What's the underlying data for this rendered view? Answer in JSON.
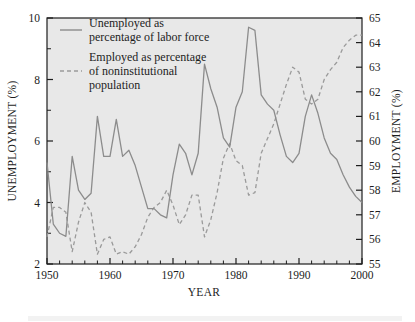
{
  "chart_data": {
    "type": "line",
    "title": "",
    "xlabel": "YEAR",
    "ylabel": "UNEMPLOYMENT (%)",
    "y2label": "EMPLOYMENT (%)",
    "xlim": [
      1950,
      2000
    ],
    "ylim": [
      2,
      10
    ],
    "y2lim": [
      55,
      65
    ],
    "grid": false,
    "legend_position": "top-left inside plot",
    "x_ticks_major": [
      1950,
      1960,
      1970,
      1980,
      1990,
      2000
    ],
    "x_ticks_minor_step": 2,
    "y_ticks_major": [
      2,
      4,
      6,
      8,
      10
    ],
    "y_ticks_minor_step": 1,
    "y2_ticks_major": [
      55,
      56,
      57,
      58,
      59,
      60,
      61,
      62,
      63,
      64,
      65
    ],
    "x": [
      1950,
      1951,
      1952,
      1953,
      1954,
      1955,
      1956,
      1957,
      1958,
      1959,
      1960,
      1961,
      1962,
      1963,
      1964,
      1965,
      1966,
      1967,
      1968,
      1969,
      1970,
      1971,
      1972,
      1973,
      1974,
      1975,
      1976,
      1977,
      1978,
      1979,
      1980,
      1981,
      1982,
      1983,
      1984,
      1985,
      1986,
      1987,
      1988,
      1989,
      1990,
      1991,
      1992,
      1993,
      1994,
      1995,
      1996,
      1997,
      1998,
      1999,
      2000
    ],
    "series": [
      {
        "name": "Unemployed as percentage of labor force",
        "style": "solid",
        "axis": "left",
        "color": "#8c8c8c",
        "values": [
          5.3,
          3.3,
          3.0,
          2.9,
          5.5,
          4.4,
          4.1,
          4.3,
          6.8,
          5.5,
          5.5,
          6.7,
          5.5,
          5.7,
          5.2,
          4.5,
          3.8,
          3.8,
          3.6,
          3.5,
          4.9,
          5.9,
          5.6,
          4.9,
          5.6,
          8.5,
          7.7,
          7.1,
          6.1,
          5.8,
          7.1,
          7.6,
          9.7,
          9.6,
          7.5,
          7.2,
          7.0,
          6.2,
          5.5,
          5.3,
          5.6,
          6.8,
          7.5,
          6.9,
          6.1,
          5.6,
          5.4,
          4.9,
          4.5,
          4.2,
          4.0
        ]
      },
      {
        "name": "Employed as percentage of noninstitutional population",
        "style": "dashed",
        "axis": "right",
        "color": "#9a9a9a",
        "values": [
          56.1,
          57.3,
          57.3,
          57.1,
          55.5,
          56.7,
          57.5,
          57.1,
          55.4,
          56.0,
          56.1,
          55.4,
          55.5,
          55.4,
          55.7,
          56.2,
          56.9,
          57.3,
          57.5,
          58.0,
          57.4,
          56.6,
          57.0,
          57.8,
          57.8,
          56.1,
          56.8,
          57.9,
          59.3,
          59.9,
          59.2,
          59.0,
          57.8,
          57.9,
          59.5,
          60.1,
          60.7,
          61.5,
          62.3,
          63.0,
          62.8,
          61.7,
          61.5,
          61.7,
          62.5,
          62.9,
          63.2,
          63.8,
          64.1,
          64.3,
          64.3
        ]
      }
    ],
    "legend": [
      {
        "label_line1": "Unemployed as",
        "label_line2": "percentage of labor force",
        "style": "solid"
      },
      {
        "label_line1": "Employed as percentage",
        "label_line2": "of noninstitutional",
        "label_line3": "population",
        "style": "dashed"
      }
    ],
    "colors": {
      "plot_background": "#e8e8e8",
      "axis": "#1d1d1d",
      "text": "#1d1d1d",
      "solid_line": "#8c8c8c",
      "dashed_line": "#9a9a9a",
      "page_background": "#ffffff"
    }
  }
}
